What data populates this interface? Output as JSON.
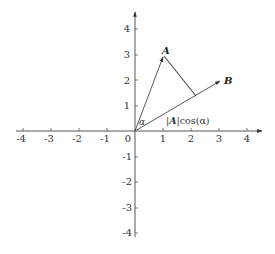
{
  "diagram": {
    "axes": {
      "x_ticks": [
        "-4",
        "-3",
        "-2",
        "-1",
        "0",
        "1",
        "2",
        "3",
        "4"
      ],
      "y_ticks": [
        "4",
        "3",
        "2",
        "1",
        "-1",
        "-2",
        "-3",
        "-4"
      ],
      "origin_label": "0",
      "x_range": [
        -4,
        4
      ],
      "y_range": [
        -4,
        4
      ]
    },
    "vectors": [
      {
        "name": "A",
        "label": "A",
        "x": 1,
        "y": 3
      },
      {
        "name": "B",
        "label": "B",
        "x": 3,
        "y": 2
      }
    ],
    "angle_label": "α",
    "projection_label": {
      "prefix": "|",
      "vector": "A",
      "suffix": "|cos(α)"
    },
    "colors": {
      "axis": "#333333",
      "vector": "#333333",
      "background": "#ffffff"
    }
  }
}
